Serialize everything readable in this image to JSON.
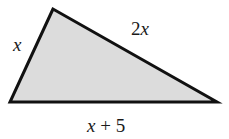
{
  "diagram": {
    "type": "triangle",
    "fill_color": "#dcdcdc",
    "stroke_color": "#111111",
    "vertices": [
      [
        53,
        9
      ],
      [
        10,
        102
      ],
      [
        217,
        102
      ]
    ],
    "sides": {
      "left": "x",
      "top_right": "2x",
      "bottom": "x + 5"
    }
  },
  "labels": {
    "left_var": "x",
    "top_coef": "2",
    "top_var": "x",
    "bottom_var": "x",
    "bottom_rest": " + 5"
  }
}
